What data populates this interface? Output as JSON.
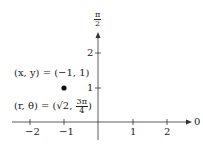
{
  "diagram": {
    "type": "polar-point-plot",
    "axes": {
      "x_ticks": [
        {
          "value": -2,
          "label": "−2"
        },
        {
          "value": -1,
          "label": "−1"
        },
        {
          "value": 1,
          "label": "1"
        },
        {
          "value": 2,
          "label": "2"
        }
      ],
      "y_ticks": [
        {
          "value": 1,
          "label": "1"
        },
        {
          "value": 2,
          "label": "2"
        }
      ],
      "polar_axis_label": "0",
      "vertical_axis_label": {
        "num": "π",
        "den": "2"
      }
    },
    "point": {
      "x": -1,
      "y": 1
    },
    "labels": {
      "cartesian": "(x, y) = (−1, 1)",
      "polar_prefix": "(r, θ) = (",
      "sqrt": "√2",
      "comma": ", ",
      "angle_num": "3π",
      "angle_den": "4",
      "polar_suffix": ")"
    }
  }
}
